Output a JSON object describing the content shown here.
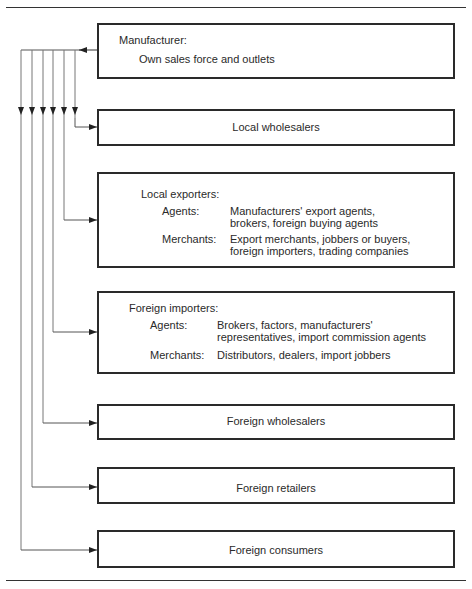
{
  "diagram": {
    "type": "flow",
    "boxes": {
      "manufacturer": {
        "title": "Manufacturer:",
        "line": "Own sales force and outlets"
      },
      "local_wholesalers": {
        "label": "Local wholesalers"
      },
      "local_exporters": {
        "title": "Local exporters:",
        "agents_label": "Agents:",
        "agents_line1": "Manufacturers' export agents,",
        "agents_line2": "brokers, foreign buying agents",
        "merchants_label": "Merchants:",
        "merchants_line1": "Export merchants, jobbers or buyers,",
        "merchants_line2": "foreign importers, trading companies"
      },
      "foreign_importers": {
        "title": "Foreign importers:",
        "agents_label": "Agents:",
        "agents_line1": "Brokers, factors, manufacturers'",
        "agents_line2": "representatives, import commission agents",
        "merchants_label": "Merchants:",
        "merchants_line1": "Distributors, dealers, import jobbers"
      },
      "foreign_wholesalers": {
        "label": "Foreign wholesalers"
      },
      "foreign_retailers": {
        "label": "Foreign retailers"
      },
      "foreign_consumers": {
        "label": "Foreign consumers"
      }
    },
    "edges": [
      {
        "from": "Manufacturer",
        "to": "Local wholesalers"
      },
      {
        "from": "Manufacturer",
        "to": "Local exporters"
      },
      {
        "from": "Manufacturer",
        "to": "Foreign importers"
      },
      {
        "from": "Manufacturer",
        "to": "Foreign wholesalers"
      },
      {
        "from": "Manufacturer",
        "to": "Foreign retailers"
      },
      {
        "from": "Manufacturer",
        "to": "Foreign consumers"
      }
    ]
  }
}
